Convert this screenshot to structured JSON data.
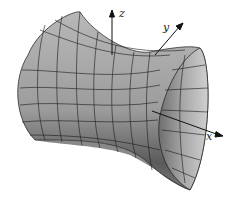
{
  "figure": {
    "axes": {
      "x_label": "x",
      "y_label": "y",
      "z_label": "z"
    },
    "colors": {
      "surface_light": "#c8c8c8",
      "surface_mid": "#9a9a9a",
      "surface_dark": "#555555",
      "grid": "#1a1a1a",
      "axis": "#111111"
    }
  }
}
